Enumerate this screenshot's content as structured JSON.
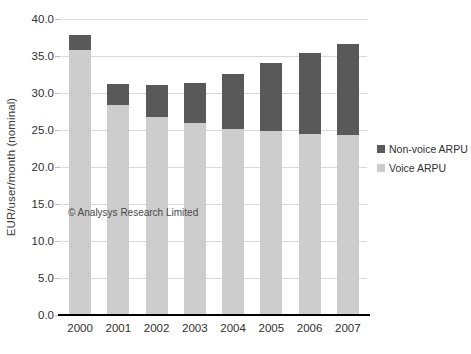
{
  "chart_data": {
    "type": "bar",
    "subtype": "stacked-vertical",
    "title": "",
    "xlabel": "",
    "ylabel": "EUR/user/month (nominal)",
    "ylim": [
      0.0,
      40.0
    ],
    "ytick_step": 5.0,
    "ytick_labels": [
      "40.0",
      "35.0",
      "30.0",
      "25.0",
      "20.0",
      "15.0",
      "10.0",
      "5.0",
      "0.0"
    ],
    "ytick_values": [
      40.0,
      35.0,
      30.0,
      25.0,
      20.0,
      15.0,
      10.0,
      5.0,
      0.0
    ],
    "grid": true,
    "grid_axis": "y",
    "legend_position": "right",
    "categories": [
      "2000",
      "2001",
      "2002",
      "2003",
      "2004",
      "2005",
      "2006",
      "2007"
    ],
    "series": [
      {
        "name": "Voice ARPU",
        "color": "#cdcdcd",
        "values": [
          35.8,
          28.4,
          26.8,
          25.9,
          25.2,
          24.8,
          24.4,
          24.3
        ]
      },
      {
        "name": "Non-voice ARPU",
        "color": "#595959",
        "values": [
          2.0,
          2.8,
          4.3,
          5.5,
          7.4,
          9.3,
          11.0,
          12.3
        ]
      }
    ],
    "totals": [
      37.8,
      31.2,
      31.1,
      31.4,
      32.6,
      34.1,
      35.4,
      36.6
    ],
    "stack_order": [
      "Voice ARPU",
      "Non-voice ARPU"
    ],
    "annotations": [
      {
        "name": "copyright-watermark",
        "text": "© Analysys Research Limited"
      }
    ]
  },
  "legend": {
    "items": [
      {
        "label": "Non-voice ARPU",
        "color": "#595959"
      },
      {
        "label": "Voice ARPU",
        "color": "#cdcdcd"
      }
    ]
  },
  "colors": {
    "voice": "#cdcdcd",
    "non_voice": "#595959",
    "gridline": "#d9d9d9",
    "axis": "#000000",
    "text": "#2f2f2f",
    "background": "#ffffff"
  }
}
